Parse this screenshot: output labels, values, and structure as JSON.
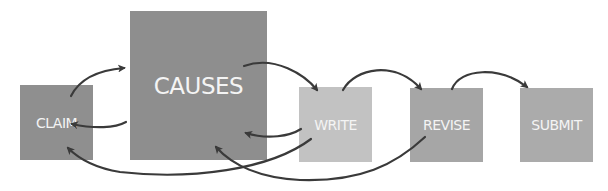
{
  "diagram": {
    "type": "process-flow",
    "nodes": [
      {
        "id": "claim",
        "label": "CLAIM",
        "color": "#8f8f8f"
      },
      {
        "id": "causes",
        "label": "CAUSES",
        "color": "#8e8e8e"
      },
      {
        "id": "write",
        "label": "WRITE",
        "color": "#c2c2c2"
      },
      {
        "id": "revise",
        "label": "REVISE",
        "color": "#a6a6a6"
      },
      {
        "id": "submit",
        "label": "SUBMIT",
        "color": "#ababab"
      }
    ],
    "edges": [
      {
        "from": "claim",
        "to": "causes"
      },
      {
        "from": "causes",
        "to": "claim"
      },
      {
        "from": "causes",
        "to": "write"
      },
      {
        "from": "write",
        "to": "causes"
      },
      {
        "from": "write",
        "to": "claim"
      },
      {
        "from": "write",
        "to": "revise"
      },
      {
        "from": "revise",
        "to": "causes"
      },
      {
        "from": "revise",
        "to": "submit"
      }
    ],
    "arrow_color": "#3a3a3a"
  }
}
